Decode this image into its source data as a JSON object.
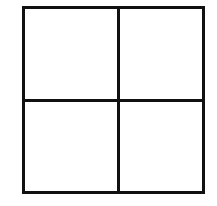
{
  "diagram": {
    "type": "grid",
    "rows": 2,
    "columns": 2,
    "line_color": "#111111",
    "background_color": "#ffffff",
    "cells": [
      {
        "row": 0,
        "col": 0,
        "content": ""
      },
      {
        "row": 0,
        "col": 1,
        "content": ""
      },
      {
        "row": 1,
        "col": 0,
        "content": ""
      },
      {
        "row": 1,
        "col": 1,
        "content": ""
      }
    ]
  }
}
